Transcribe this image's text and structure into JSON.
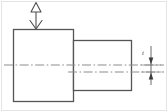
{
  "drawing": {
    "title": "Stepped shaft symmetry tolerance drawing",
    "background_color": "#ffffff",
    "line_color": "#555555",
    "centerline_color": "#8a8a8a",
    "border_color": "#d8d8d8",
    "annotation_label": "t",
    "datum_symbol": "triangle-arrow",
    "shapes": {
      "large_body": {
        "name": "large-diameter-body",
        "x": 13,
        "y": 29,
        "width": 61,
        "height": 73
      },
      "small_body": {
        "name": "small-diameter-body",
        "x": 74,
        "y": 40,
        "width": 58,
        "height": 51
      }
    },
    "centerlines": [
      {
        "name": "datum-axis-centerline",
        "x1": 4,
        "y1": 65,
        "x2": 164,
        "y2": 65
      },
      {
        "name": "feature-axis-centerline",
        "x1": 68,
        "y1": 72,
        "x2": 164,
        "y2": 72
      }
    ],
    "datum_indicator": {
      "name": "datum-feature-symbol",
      "triangle_cx": 36,
      "triangle_cy": 8,
      "leader_x": 36,
      "leader_top": 12,
      "leader_bottom": 29
    },
    "dimension": {
      "name": "tolerance-dimension",
      "x": 151,
      "top": 58,
      "bottom": 79,
      "extension_left": 143,
      "extension_right": 160,
      "label": "t",
      "label_x": 144,
      "label_y": 54
    }
  }
}
